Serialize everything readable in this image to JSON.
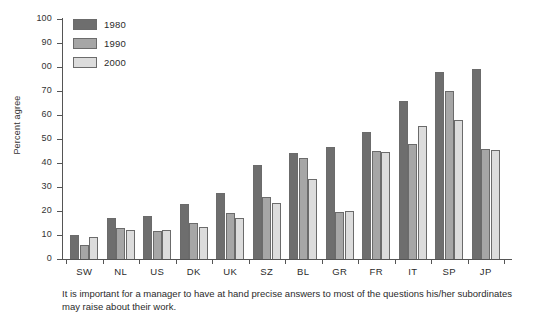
{
  "chart_data": {
    "type": "bar",
    "title": "",
    "subtitle": "",
    "xlabel": "",
    "ylabel": "Percent agree",
    "ylim": [
      0,
      100
    ],
    "ytick_values": [
      0,
      10,
      20,
      30,
      40,
      50,
      60,
      70,
      80,
      90,
      100
    ],
    "ytick_labels": [
      "0",
      "10",
      "20",
      "30",
      "40",
      "50",
      "60",
      "70",
      "00",
      "90",
      "100"
    ],
    "grid": false,
    "legend_position": "top-left",
    "categories": [
      "SW",
      "NL",
      "US",
      "DK",
      "UK",
      "SZ",
      "BL",
      "GR",
      "FR",
      "IT",
      "SP",
      "JP"
    ],
    "series": [
      {
        "name": "1980",
        "color": "#6e6e6e",
        "values": [
          10,
          17,
          18,
          23,
          27.5,
          39,
          44,
          46.5,
          53,
          66,
          78,
          79
        ]
      },
      {
        "name": "1990",
        "color": "#a6a6a6",
        "values": [
          6,
          13,
          11.5,
          15,
          19,
          26,
          42,
          19.5,
          45,
          48,
          70,
          46
        ]
      },
      {
        "name": "2000",
        "color": "#dcdcdc",
        "values": [
          9,
          12,
          12,
          13.5,
          17,
          23.5,
          33.5,
          20,
          44.5,
          55.5,
          58,
          45.5
        ]
      }
    ],
    "annotations": []
  },
  "legend": {
    "entries": [
      {
        "label": "1980",
        "color": "#6e6e6e"
      },
      {
        "label": "1990",
        "color": "#a6a6a6"
      },
      {
        "label": "2000",
        "color": "#dcdcdc"
      }
    ]
  },
  "caption": {
    "text": "It is important for a manager to have at hand precise answers to most of the questions his/her subordinates may raise about their work."
  },
  "colors": {
    "axis": "#555555",
    "text": "#2b2b2b",
    "background": "#ffffff",
    "bar_outline": "#6b6b6b"
  }
}
